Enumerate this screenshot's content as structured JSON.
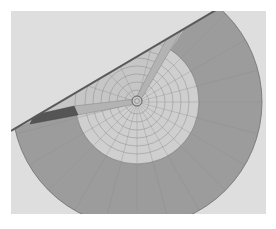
{
  "figure": {
    "kind": "finite-element model render",
    "caption": "",
    "colors": {
      "page_background": "#ffffff",
      "panel_background": "#dedede",
      "outer_ring": "#9c9c9c",
      "inner_disc": "#cfcfcf",
      "cut_upper_region": "#c4c4c4",
      "spoke_light": "#b3b3b3",
      "spoke_dark": "#555555",
      "edge_line": "#5a5a5a",
      "mesh_line": "#8a8a8a",
      "hub": "#707070"
    },
    "geometry": {
      "center": [
        137,
        102
      ],
      "outer_radius": 125,
      "inner_radius": 62,
      "hub_radius": 5,
      "cut_line": [
        [
          11,
          130
        ],
        [
          215,
          11
        ]
      ]
    }
  }
}
